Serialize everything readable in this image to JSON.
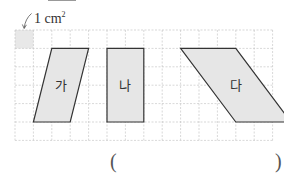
{
  "unit": {
    "number": "1",
    "unit": "cm",
    "exponent": "2"
  },
  "grid": {
    "left": 15,
    "top": 30,
    "cell": 18.4,
    "cols": 14,
    "rows": 6
  },
  "shapes": [
    {
      "label": "가",
      "type": "parallelogram",
      "points": [
        [
          2,
          1
        ],
        [
          4,
          1
        ],
        [
          3,
          5
        ],
        [
          1,
          5
        ]
      ]
    },
    {
      "label": "나",
      "type": "rectangle",
      "points": [
        [
          5,
          1
        ],
        [
          7,
          1
        ],
        [
          7,
          5
        ],
        [
          5,
          5
        ]
      ]
    },
    {
      "label": "다",
      "type": "parallelogram",
      "points": [
        [
          9,
          1
        ],
        [
          12,
          1
        ],
        [
          15,
          5
        ],
        [
          12,
          5
        ]
      ]
    }
  ],
  "answer": {
    "open": "(",
    "close": ")",
    "value": ""
  },
  "colors": {
    "fill": "#e6e6e6",
    "stroke": "#333333",
    "grid": "#bdbdbd",
    "unit_cell": "#e8e8e8"
  }
}
